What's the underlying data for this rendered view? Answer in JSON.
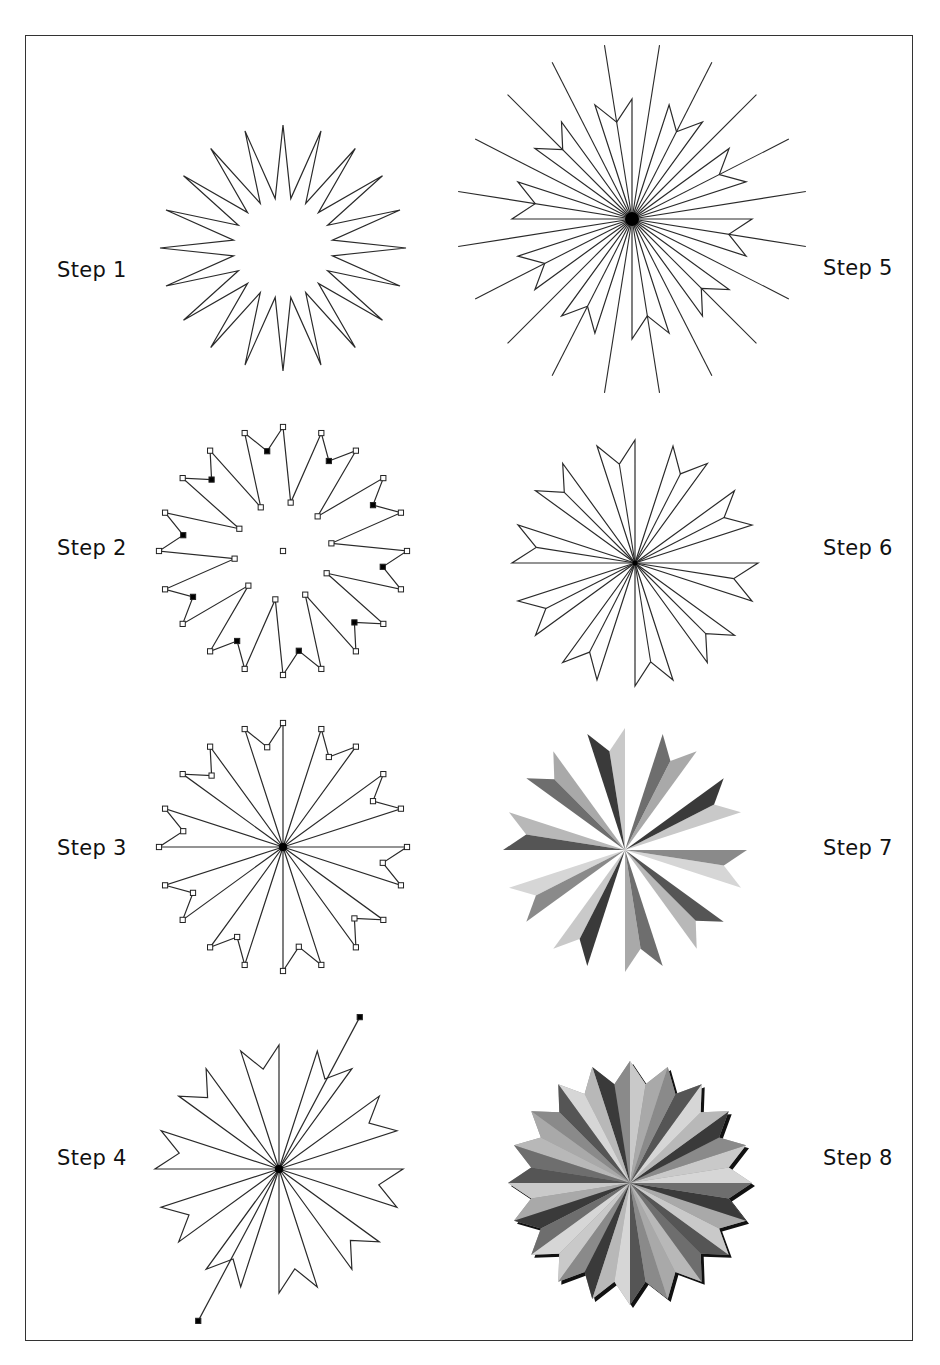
{
  "page": {
    "frame": {
      "x": 25,
      "y": 35,
      "width": 888,
      "height": 1306
    }
  },
  "colors": {
    "stroke": "#2a2a2a",
    "marker_fill": "#000000",
    "shadow": "#111111",
    "shades": [
      "#c9c9c9",
      "#8a8a8a",
      "#a9a9a9",
      "#3a3a3a",
      "#b8b8b8",
      "#6e6e6e",
      "#d6d6d6",
      "#555555"
    ]
  },
  "steps": [
    {
      "label": "Step 1",
      "label_x": 57,
      "label_y": 270,
      "kind": "star",
      "cx": 283,
      "cy": 248,
      "r_outer": 123,
      "r_inner": 50
    },
    {
      "label": "Step 2",
      "label_x": 57,
      "label_y": 548,
      "kind": "markers",
      "cx": 283,
      "cy": 551,
      "r_outer": 124,
      "r_inner": 49,
      "r_notch": 101
    },
    {
      "label": "Step 3",
      "label_x": 57,
      "label_y": 848,
      "kind": "petals-markers",
      "cx": 283,
      "cy": 847,
      "r_outer": 124,
      "r_notch": 101
    },
    {
      "label": "Step 4",
      "label_x": 57,
      "label_y": 1158,
      "kind": "petals-line",
      "cx": 279,
      "cy": 1169,
      "r_outer": 124,
      "r_notch": 101,
      "line_angle": 62,
      "line_r1": 172,
      "line_r2": 172
    },
    {
      "label": "Step 5",
      "label_x": 823,
      "label_y": 268,
      "kind": "petals-rays",
      "cx": 632,
      "cy": 219,
      "r_outer": 120,
      "r_notch": 98,
      "ray_r": 176
    },
    {
      "label": "Step 6",
      "label_x": 823,
      "label_y": 548,
      "kind": "petals-spokes",
      "cx": 635,
      "cy": 563,
      "r_outer": 123,
      "r_notch": 100
    },
    {
      "label": "Step 7",
      "label_x": 823,
      "label_y": 848,
      "kind": "petals-filled",
      "cx": 625,
      "cy": 850,
      "r_outer": 122,
      "r_notch": 100
    },
    {
      "label": "Step 8",
      "label_x": 823,
      "label_y": 1158,
      "kind": "star-filled",
      "cx": 630,
      "cy": 1183,
      "r_outer": 122,
      "r_inner": 100,
      "shadow_dx": 3,
      "shadow_dy": 3
    }
  ],
  "geometry": {
    "points": 20,
    "start_angle": 90,
    "step_angle": 18
  }
}
